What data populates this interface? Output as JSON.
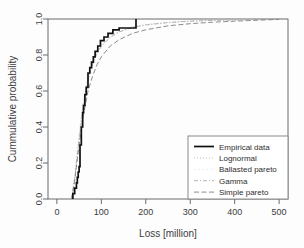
{
  "chart_data": {
    "type": "line",
    "title": "",
    "xlabel": "Loss [million]",
    "ylabel": "Cummulative probability",
    "xlim": [
      -20,
      520
    ],
    "ylim": [
      0.0,
      1.0
    ],
    "xticks": [
      0,
      100,
      200,
      300,
      400,
      500
    ],
    "yticks": [
      "0.0",
      "0.2",
      "0.4",
      "0.6",
      "0.8",
      "1.0"
    ],
    "grid": false,
    "legend_position": "bottom-right",
    "series": [
      {
        "name": "Empirical data",
        "style": "solid-step",
        "color": "#111111",
        "x": [
          35,
          36,
          40,
          44,
          46,
          48,
          50,
          52,
          55,
          58,
          60,
          63,
          66,
          70,
          74,
          78,
          82,
          86,
          92,
          98,
          106,
          115,
          126,
          140,
          150,
          178,
          178
        ],
        "y": [
          0.0,
          0.03,
          0.06,
          0.09,
          0.12,
          0.15,
          0.18,
          0.3,
          0.4,
          0.48,
          0.52,
          0.58,
          0.62,
          0.7,
          0.73,
          0.76,
          0.79,
          0.82,
          0.85,
          0.88,
          0.9,
          0.92,
          0.94,
          0.95,
          0.95,
          0.95,
          1.0
        ]
      },
      {
        "name": "Lognormal",
        "style": "dotted",
        "color": "#b9b9b9",
        "x": [
          33,
          40,
          50,
          60,
          70,
          80,
          90,
          100,
          120,
          140,
          170,
          200,
          250,
          300,
          350,
          400,
          450,
          500
        ],
        "y": [
          0.0,
          0.12,
          0.35,
          0.54,
          0.67,
          0.75,
          0.81,
          0.85,
          0.9,
          0.93,
          0.955,
          0.968,
          0.981,
          0.988,
          0.992,
          0.995,
          0.997,
          0.999
        ]
      },
      {
        "name": "Ballasted pareto",
        "style": "fine-dotted",
        "color": "#cccccc",
        "x": [
          33,
          40,
          50,
          60,
          70,
          80,
          90,
          100,
          120,
          140,
          170,
          200,
          250,
          300,
          350,
          400,
          450,
          500
        ],
        "y": [
          0.0,
          0.13,
          0.37,
          0.56,
          0.68,
          0.76,
          0.82,
          0.86,
          0.905,
          0.932,
          0.957,
          0.97,
          0.982,
          0.989,
          0.993,
          0.996,
          0.998,
          0.999
        ]
      },
      {
        "name": "Gamma",
        "style": "dash-dot",
        "color": "#adadad",
        "x": [
          33,
          40,
          50,
          60,
          70,
          80,
          90,
          100,
          120,
          140,
          170,
          200,
          250,
          300,
          350,
          400,
          450,
          500
        ],
        "y": [
          0.0,
          0.11,
          0.33,
          0.52,
          0.66,
          0.745,
          0.805,
          0.848,
          0.898,
          0.928,
          0.953,
          0.967,
          0.98,
          0.988,
          0.992,
          0.995,
          0.997,
          0.999
        ]
      },
      {
        "name": "Simple pareto",
        "style": "dashed",
        "color": "#7f7f7f",
        "x": [
          33,
          40,
          50,
          60,
          70,
          80,
          90,
          100,
          120,
          140,
          170,
          200,
          250,
          300,
          350,
          400,
          450,
          500
        ],
        "y": [
          0.0,
          0.1,
          0.3,
          0.47,
          0.6,
          0.68,
          0.745,
          0.79,
          0.85,
          0.885,
          0.92,
          0.94,
          0.962,
          0.974,
          0.982,
          0.988,
          0.993,
          0.998
        ]
      }
    ]
  },
  "legend": {
    "items": [
      {
        "label": "Empirical data"
      },
      {
        "label": "Lognormal"
      },
      {
        "label": "Ballasted pareto"
      },
      {
        "label": "Gamma"
      },
      {
        "label": "Simple pareto"
      }
    ]
  }
}
